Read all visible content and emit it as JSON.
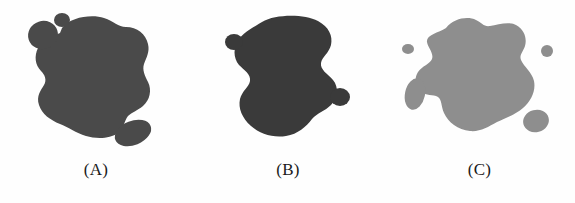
{
  "figure": {
    "background_color": "#fefefe",
    "width": 575,
    "height": 203
  },
  "panels": [
    {
      "id": "panel-a",
      "label": "(A)",
      "shape_name": "blob-a",
      "fill_color": "#4a4a4a",
      "satellite_count": 3,
      "satellites": [
        {
          "name": "satellite-top-left-round",
          "shape": "rounded-blob"
        },
        {
          "name": "satellite-top-dot",
          "shape": "small-circle"
        },
        {
          "name": "satellite-bottom-right-oval",
          "shape": "elongated-oval"
        }
      ]
    },
    {
      "id": "panel-b",
      "label": "(B)",
      "shape_name": "blob-b",
      "fill_color": "#3a3a3a",
      "satellite_count": 2,
      "satellites": [
        {
          "name": "satellite-left-circle",
          "shape": "small-circle"
        },
        {
          "name": "satellite-right-circle",
          "shape": "small-circle"
        }
      ]
    },
    {
      "id": "panel-c",
      "label": "(C)",
      "shape_name": "blob-c",
      "fill_color": "#8e8e8e",
      "satellite_count": 4,
      "satellites": [
        {
          "name": "satellite-left-dot",
          "shape": "tiny-circle"
        },
        {
          "name": "satellite-right-dot",
          "shape": "tiny-circle"
        },
        {
          "name": "satellite-lower-left-oval",
          "shape": "elongated-oval"
        },
        {
          "name": "satellite-lower-right-round",
          "shape": "rounded-blob"
        }
      ]
    }
  ]
}
